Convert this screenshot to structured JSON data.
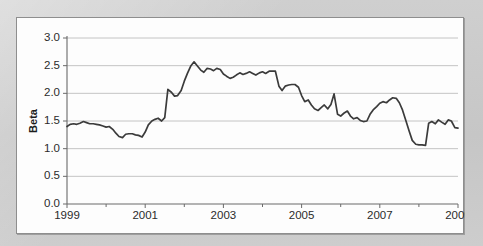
{
  "card": {
    "background": "#fdfdfd",
    "border_color": "#8e8e8e"
  },
  "page": {
    "background": "#c9c9c9"
  },
  "chart_data": {
    "type": "line",
    "title": "",
    "subtitle": "",
    "xlabel": "",
    "ylabel": "Beta",
    "xlim": [
      1999,
      2009
    ],
    "ylim": [
      0.0,
      3.0
    ],
    "grid": true,
    "grid_axis": "y",
    "legend": false,
    "legend_position": "none",
    "line_color": "#3b3b3b",
    "ytick_labels": [
      "0.0",
      "0.5",
      "1.0",
      "1.5",
      "2.0",
      "2.5",
      "3.0"
    ],
    "ytick_values": [
      0.0,
      0.5,
      1.0,
      1.5,
      2.0,
      2.5,
      3.0
    ],
    "xtick_labels": [
      "1999",
      "2001",
      "2003",
      "2005",
      "2007",
      "2009"
    ],
    "xtick_values": [
      1999,
      2001,
      2003,
      2005,
      2007,
      2009
    ],
    "xminor_tick_values": [
      2000,
      2002,
      2004,
      2006,
      2008
    ],
    "series": [
      {
        "name": "Beta",
        "x": [
          1999.0,
          1999.08,
          1999.17,
          1999.25,
          1999.33,
          1999.42,
          1999.5,
          1999.58,
          1999.67,
          1999.75,
          1999.83,
          1999.92,
          2000.0,
          2000.08,
          2000.17,
          2000.25,
          2000.33,
          2000.42,
          2000.5,
          2000.58,
          2000.67,
          2000.75,
          2000.83,
          2000.92,
          2001.0,
          2001.08,
          2001.17,
          2001.25,
          2001.33,
          2001.42,
          2001.5,
          2001.58,
          2001.67,
          2001.75,
          2001.83,
          2001.92,
          2002.0,
          2002.08,
          2002.17,
          2002.25,
          2002.33,
          2002.42,
          2002.5,
          2002.58,
          2002.67,
          2002.75,
          2002.83,
          2002.92,
          2003.0,
          2003.08,
          2003.17,
          2003.25,
          2003.33,
          2003.42,
          2003.5,
          2003.58,
          2003.67,
          2003.75,
          2003.83,
          2003.92,
          2004.0,
          2004.08,
          2004.17,
          2004.25,
          2004.33,
          2004.42,
          2004.5,
          2004.58,
          2004.67,
          2004.75,
          2004.83,
          2004.92,
          2005.0,
          2005.08,
          2005.17,
          2005.25,
          2005.33,
          2005.42,
          2005.5,
          2005.58,
          2005.67,
          2005.75,
          2005.83,
          2005.92,
          2006.0,
          2006.08,
          2006.17,
          2006.25,
          2006.33,
          2006.42,
          2006.5,
          2006.58,
          2006.67,
          2006.75,
          2006.83,
          2006.92,
          2007.0,
          2007.08,
          2007.17,
          2007.25,
          2007.33,
          2007.42,
          2007.5,
          2007.58,
          2007.67,
          2007.75,
          2007.83,
          2007.92,
          2008.0,
          2008.08,
          2008.17,
          2008.25,
          2008.33,
          2008.42,
          2008.5,
          2008.58,
          2008.67,
          2008.75,
          2008.83,
          2008.92,
          2009.0
        ],
        "values": [
          1.4,
          1.44,
          1.45,
          1.44,
          1.46,
          1.49,
          1.47,
          1.45,
          1.45,
          1.44,
          1.43,
          1.41,
          1.39,
          1.4,
          1.35,
          1.28,
          1.22,
          1.2,
          1.26,
          1.27,
          1.27,
          1.25,
          1.24,
          1.21,
          1.3,
          1.43,
          1.5,
          1.53,
          1.55,
          1.5,
          1.56,
          2.07,
          2.02,
          1.95,
          1.96,
          2.05,
          2.22,
          2.36,
          2.5,
          2.57,
          2.5,
          2.42,
          2.38,
          2.45,
          2.44,
          2.41,
          2.45,
          2.43,
          2.35,
          2.31,
          2.27,
          2.29,
          2.33,
          2.37,
          2.34,
          2.36,
          2.39,
          2.36,
          2.33,
          2.37,
          2.39,
          2.36,
          2.4,
          2.4,
          2.4,
          2.13,
          2.05,
          2.13,
          2.15,
          2.16,
          2.16,
          2.11,
          1.96,
          1.85,
          1.88,
          1.79,
          1.72,
          1.69,
          1.74,
          1.79,
          1.72,
          1.8,
          1.99,
          1.62,
          1.59,
          1.64,
          1.68,
          1.59,
          1.54,
          1.56,
          1.51,
          1.49,
          1.5,
          1.62,
          1.7,
          1.76,
          1.82,
          1.85,
          1.83,
          1.88,
          1.92,
          1.91,
          1.83,
          1.7,
          1.5,
          1.32,
          1.15,
          1.08,
          1.07,
          1.07,
          1.06,
          1.46,
          1.49,
          1.45,
          1.52,
          1.48,
          1.44,
          1.52,
          1.5,
          1.38,
          1.37
        ]
      }
    ]
  }
}
